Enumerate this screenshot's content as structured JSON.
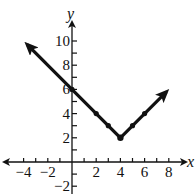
{
  "chart_data": {
    "type": "line",
    "title": "",
    "xlabel": "x",
    "ylabel": "y",
    "xlim": [
      -4.5,
      8.7
    ],
    "ylim": [
      -2.5,
      11
    ],
    "grid": false,
    "x_ticks": [
      -4,
      -2,
      2,
      4,
      6,
      8
    ],
    "y_ticks": [
      -2,
      2,
      4,
      6,
      8,
      10
    ],
    "x_tick_labels": [
      "−4",
      "−2",
      "2",
      "4",
      "6",
      "8"
    ],
    "y_tick_labels": [
      "−2",
      "2",
      "4",
      "6",
      "8",
      "10"
    ],
    "series": [
      {
        "name": "y = |x − 4| + 2",
        "x": [
          -3.7,
          0,
          2,
          3,
          4,
          5,
          6,
          7.8
        ],
        "y": [
          9.7,
          6,
          4,
          3,
          2,
          3,
          4,
          5.8
        ],
        "arrows": "both ends",
        "marked_points": [
          [
            0,
            6
          ],
          [
            2,
            4
          ],
          [
            3,
            3
          ],
          [
            4,
            2
          ],
          [
            5,
            3
          ],
          [
            6,
            4
          ]
        ],
        "vertex": [
          4,
          2
        ]
      }
    ]
  }
}
